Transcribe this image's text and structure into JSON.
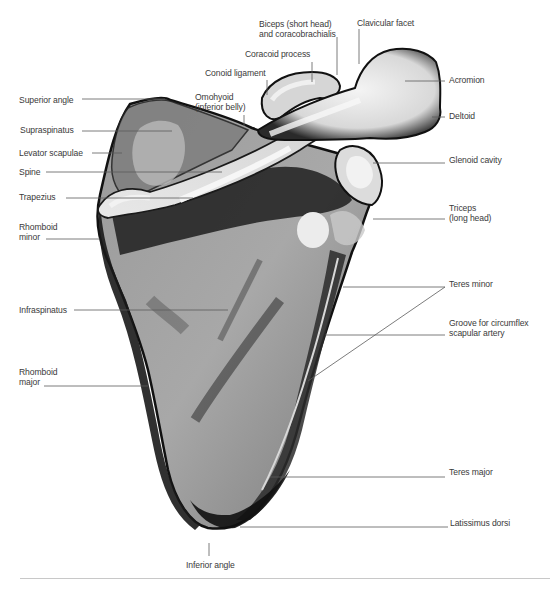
{
  "figure": {
    "labels": [
      {
        "id": "superior-angle",
        "text": "Superior angle",
        "x": 19,
        "y": 95,
        "line": [
          [
            82,
            99
          ],
          [
            165,
            99
          ]
        ]
      },
      {
        "id": "supraspinatus",
        "text": "Supraspinatus",
        "x": 20,
        "y": 125,
        "line": [
          [
            82,
            131
          ],
          [
            172,
            131
          ]
        ]
      },
      {
        "id": "levator-scapulae",
        "text": "Levator scapulae",
        "x": 19,
        "y": 148,
        "line": [
          [
            92,
            153
          ],
          [
            122,
            153
          ]
        ]
      },
      {
        "id": "spine",
        "text": "Spine",
        "x": 19,
        "y": 167,
        "line": [
          [
            46,
            172
          ],
          [
            222,
            172
          ]
        ]
      },
      {
        "id": "trapezius",
        "text": "Trapezius",
        "x": 19,
        "y": 192,
        "line": [
          [
            66,
            198
          ],
          [
            193,
            198
          ]
        ]
      },
      {
        "id": "rhomboid-minor",
        "text": "Rhomboid\nminor",
        "x": 19,
        "y": 222,
        "line": [
          [
            46,
            239
          ],
          [
            100,
            239
          ]
        ]
      },
      {
        "id": "infraspinatus",
        "text": "Infraspinatus",
        "x": 19,
        "y": 305,
        "line": [
          [
            74,
            310
          ],
          [
            228,
            310
          ]
        ]
      },
      {
        "id": "rhomboid-major",
        "text": "Rhomboid\nmajor",
        "x": 19,
        "y": 367,
        "line": [
          [
            44,
            386
          ],
          [
            148,
            386
          ]
        ]
      },
      {
        "id": "biceps-coracobrachialis",
        "text": "Biceps (short head)\nand coracobrachialis",
        "x": 259,
        "y": 19,
        "line": [
          [
            337,
            37
          ],
          [
            337,
            75
          ]
        ]
      },
      {
        "id": "clavicular-facet",
        "text": "Clavicular facet",
        "x": 357,
        "y": 18,
        "line": [
          [
            359,
            29
          ],
          [
            359,
            64
          ]
        ]
      },
      {
        "id": "coracoid-process",
        "text": "Coracoid process",
        "x": 245,
        "y": 49,
        "line": [
          [
            312,
            62
          ],
          [
            312,
            82
          ]
        ]
      },
      {
        "id": "conoid-ligament",
        "text": "Conoid ligament",
        "x": 205,
        "y": 68,
        "line": [
          [
            267,
            80
          ],
          [
            267,
            95
          ]
        ]
      },
      {
        "id": "omohyoid",
        "text": "Omohyoid\n(inferior belly)",
        "x": 195,
        "y": 92,
        "line": [
          [
            244,
            115
          ],
          [
            244,
            126
          ]
        ]
      },
      {
        "id": "acromion",
        "text": "Acromion",
        "x": 449,
        "y": 75,
        "line": [
          [
            405,
            81
          ],
          [
            445,
            81
          ]
        ]
      },
      {
        "id": "deltoid",
        "text": "Deltoid",
        "x": 449,
        "y": 111,
        "line": [
          [
            432,
            117
          ],
          [
            445,
            117
          ]
        ]
      },
      {
        "id": "glenoid-cavity",
        "text": "Glenoid cavity",
        "x": 449,
        "y": 155,
        "line": [
          [
            373,
            163
          ],
          [
            445,
            163
          ]
        ]
      },
      {
        "id": "triceps",
        "text": "Triceps\n(long head)",
        "x": 449,
        "y": 203,
        "line": [
          [
            373,
            219
          ],
          [
            445,
            219
          ]
        ]
      },
      {
        "id": "teres-minor",
        "text": "Teres minor",
        "x": 449,
        "y": 279,
        "line": [
          [
            343,
            287
          ],
          [
            445,
            287
          ]
        ],
        "line2": [
          [
            445,
            287
          ],
          [
            308,
            381
          ]
        ]
      },
      {
        "id": "groove-circumflex",
        "text": "Groove for circumflex\nscapular artery",
        "x": 449,
        "y": 318,
        "line": [
          [
            325,
            335
          ],
          [
            445,
            335
          ]
        ]
      },
      {
        "id": "teres-major",
        "text": "Teres major",
        "x": 449,
        "y": 467,
        "line": [
          [
            270,
            477
          ],
          [
            445,
            477
          ]
        ]
      },
      {
        "id": "latissimus-dorsi",
        "text": "Latissimus dorsi",
        "x": 450,
        "y": 518,
        "line": [
          [
            240,
            527
          ],
          [
            448,
            527
          ]
        ]
      },
      {
        "id": "inferior-angle",
        "text": "Inferior angle",
        "x": 186,
        "y": 560,
        "line": [
          [
            209,
            543
          ],
          [
            209,
            556
          ]
        ]
      }
    ]
  },
  "colors": {
    "label_text": "#3a3a3a",
    "leader_line": "#5a5a5a",
    "bone_dark": "#1a1a1a",
    "bone_mid": "#8e8e8e",
    "bone_light": "#e6e6e6",
    "rule": "#c8c8c8"
  }
}
